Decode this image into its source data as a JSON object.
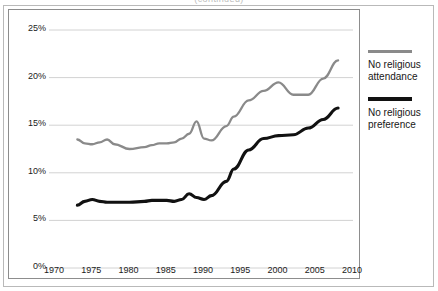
{
  "figure": {
    "cropped_title_fragment": "(continued)",
    "background_color": "#ffffff",
    "frame_color": "#8d8d8d",
    "outer_border_color": "#b9b9b9"
  },
  "legend": {
    "position": "right",
    "entries": [
      {
        "name": "no-religious-attendance",
        "label_line1": "No religious",
        "label_line2": "attendance",
        "color": "#8a8a8a",
        "stroke_width": 3
      },
      {
        "name": "no-religious-preference",
        "label_line1": "No religious",
        "label_line2": "preference",
        "color": "#111111",
        "stroke_width": 4
      }
    ]
  },
  "axes": {
    "y_ticks": [
      "0%",
      "5%",
      "10%",
      "15%",
      "20%",
      "25%"
    ],
    "x_ticks": [
      "1970",
      "1975",
      "1980",
      "1985",
      "1990",
      "1995",
      "2000",
      "2005",
      "2010"
    ],
    "grid": true,
    "gridline_color": "#d2d2d2"
  },
  "chart_data": {
    "type": "line",
    "title": "",
    "subtitle": "",
    "xlabel": "",
    "ylabel": "",
    "xlim": [
      1970,
      2010
    ],
    "ylim": [
      0,
      25
    ],
    "y_unit": "percent",
    "grid": true,
    "legend_position": "right",
    "x": [
      1973,
      1974,
      1975,
      1976,
      1977,
      1978,
      1980,
      1982,
      1983,
      1984,
      1985,
      1986,
      1987,
      1988,
      1989,
      1990,
      1991,
      1993,
      1994,
      1996,
      1998,
      2000,
      2002,
      2004,
      2006,
      2008
    ],
    "series": [
      {
        "name": "No religious attendance",
        "color": "#8a8a8a",
        "values": [
          13.5,
          13.1,
          13.0,
          13.2,
          13.5,
          13.0,
          12.5,
          12.7,
          12.9,
          13.1,
          13.1,
          13.2,
          13.6,
          14.1,
          15.4,
          13.6,
          13.4,
          14.9,
          15.9,
          17.6,
          18.6,
          19.5,
          18.2,
          18.2,
          19.9,
          21.8
        ]
      },
      {
        "name": "No religious preference",
        "color": "#111111",
        "values": [
          6.6,
          7.0,
          7.2,
          7.0,
          6.9,
          6.9,
          6.9,
          7.0,
          7.1,
          7.1,
          7.1,
          7.0,
          7.2,
          7.8,
          7.4,
          7.2,
          7.6,
          9.1,
          10.4,
          12.4,
          13.6,
          13.9,
          14.0,
          14.7,
          15.6,
          16.8
        ]
      }
    ]
  }
}
